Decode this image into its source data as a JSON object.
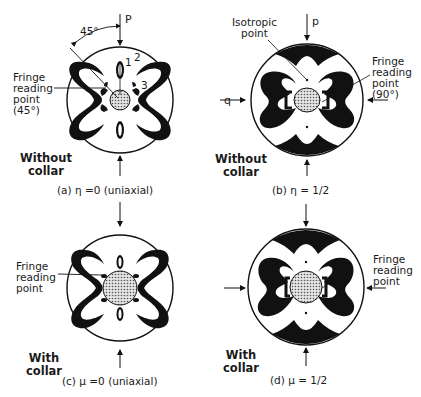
{
  "figure": {
    "panels": [
      {
        "id": "a",
        "caption": "(a) η =0 (uniaxial)",
        "condition": "Without\ncollar",
        "fringe_label": "Fringe\nreading\npoint\n(45°)",
        "angle_label": "45°",
        "load_label": "P",
        "fringe_orders": [
          "1",
          "2",
          "3"
        ]
      },
      {
        "id": "b",
        "caption": "(b) η = 1/2",
        "condition": "Without\ncollar",
        "fringe_label": "Fringe\nreading\npoint\n(90°)",
        "isotropic_label": "Isotropic\npoint",
        "load_vertical": "p",
        "load_horizontal": "q"
      },
      {
        "id": "c",
        "caption": "(c)  μ =0 (uniaxial)",
        "condition": "With\ncollar",
        "fringe_label": "Fringe\nreading\npoint"
      },
      {
        "id": "d",
        "caption": "(d)  μ = 1/2",
        "condition": "With\ncollar",
        "fringe_label": "Fringe\nreading\npoint"
      }
    ],
    "colors": {
      "ink": "#111111",
      "paper": "#ffffff",
      "hatch": "#9a9a9a"
    }
  }
}
